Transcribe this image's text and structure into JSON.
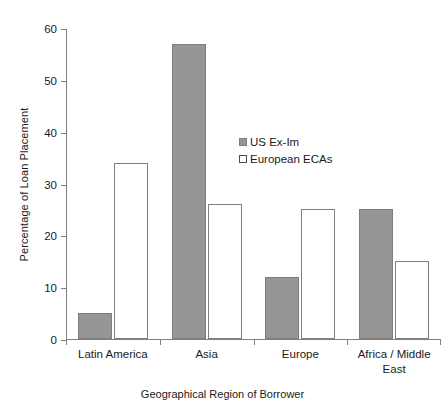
{
  "chart_data": {
    "type": "bar",
    "title": "",
    "subtitle": "",
    "xlabel": "Geographical Region of Borrower",
    "ylabel": "Percentage of Loan Placement",
    "categories": [
      "Latin America",
      "Asia",
      "Europe",
      "Africa / Middle East"
    ],
    "series": [
      {
        "name": "US Ex-Im",
        "color": "#969696",
        "values": [
          5,
          57,
          12,
          25
        ]
      },
      {
        "name": "European ECAs",
        "color": "#ffffff",
        "values": [
          34,
          26,
          25,
          15
        ]
      }
    ],
    "ylim": [
      0,
      60
    ],
    "yticks": [
      0,
      10,
      20,
      30,
      40,
      50,
      60
    ],
    "ytick_labels": [
      "0",
      "10",
      "20",
      "30",
      "40",
      "50",
      "60"
    ],
    "grid": false,
    "legend_position": "center",
    "annotations": []
  },
  "legend": {
    "entries": [
      {
        "label": "US Ex-Im",
        "swatch": "filled-gray-swatch"
      },
      {
        "label": "European ECAs",
        "swatch": "hollow-white-swatch"
      }
    ]
  },
  "axes": {
    "y_title": "Percentage of Loan Placement",
    "x_title": "Geographical Region of Borrower"
  }
}
